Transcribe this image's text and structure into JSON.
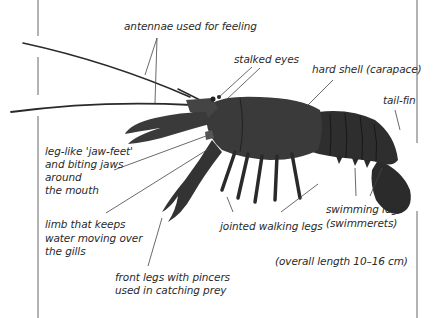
{
  "diagram": {
    "labels": {
      "antennae": "antennae used for feeling",
      "eyes": "stalked eyes",
      "shell": "hard shell (carapace)",
      "tail": "tail-fin",
      "jaw_1": "leg-like 'jaw-feet'",
      "jaw_2": "and biting jaws",
      "jaw_3": "around",
      "jaw_4": "the mouth",
      "gill_1": "limb that keeps",
      "gill_2": "water moving over",
      "gill_3": "the gills",
      "pincer_1": "front legs with pincers",
      "pincer_2": "used in catching prey",
      "walking": "jointed walking legs",
      "swim_1": "swimming legs",
      "swim_2": "(swimmerets)",
      "length": "(overall length 10–16 cm)"
    },
    "colors": {
      "body": "#3a3a3a",
      "body_dark": "#1f1f1f",
      "rule": "#8a8a8a",
      "text": "#2a2a2a",
      "leader": "#444444"
    }
  }
}
